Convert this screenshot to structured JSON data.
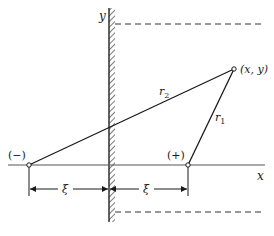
{
  "diagram": {
    "axes": {
      "x_label": "x",
      "y_label": "y"
    },
    "points": {
      "negative_charge": {
        "label": "(−)"
      },
      "positive_charge": {
        "label": "(+)"
      },
      "field_point": {
        "label": "(x, y)"
      }
    },
    "distances": {
      "r1_label": "r",
      "r1_sub": "1",
      "r2_label": "r",
      "r2_sub": "2"
    },
    "dimensions": {
      "left_xi": "ξ",
      "right_xi": "ξ"
    },
    "colors": {
      "line": "#1a1a1a",
      "axis": "#555555",
      "background": "#ffffff"
    }
  }
}
